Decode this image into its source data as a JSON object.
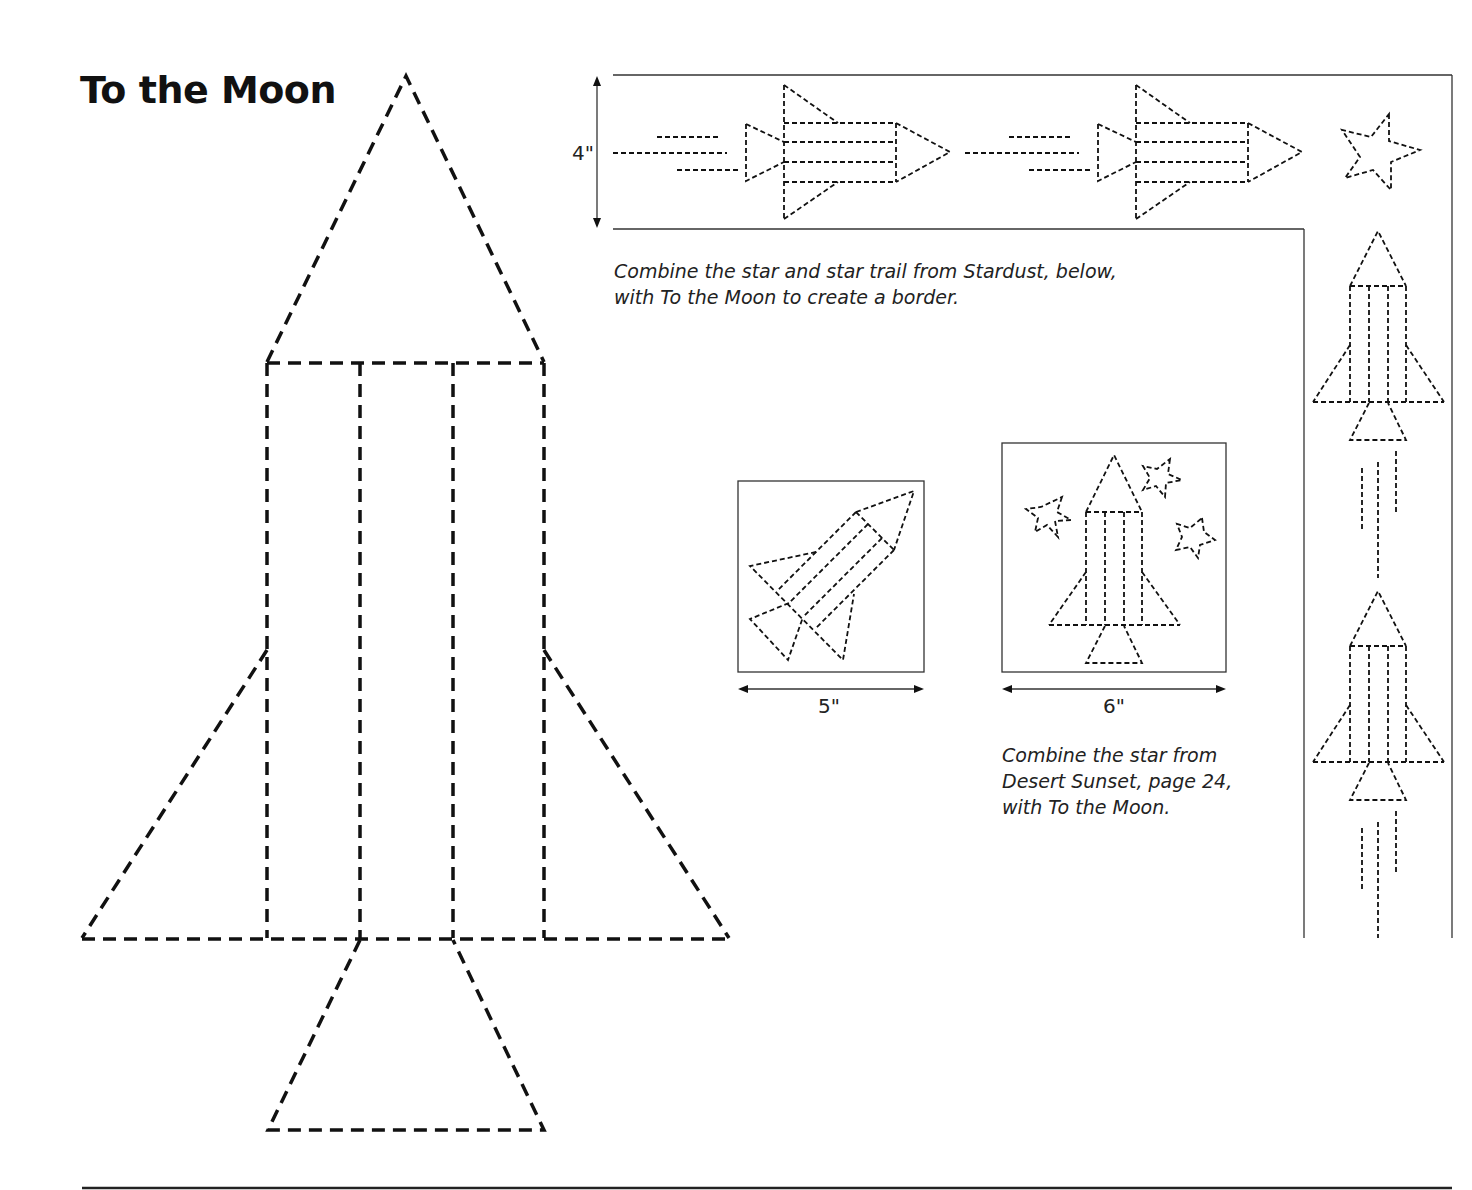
{
  "page": {
    "title": "To the Moon"
  },
  "border_block": {
    "dimension_label": "4\"",
    "caption": "Combine the star and star trail from Stardust, below, with To the Moon to create a border."
  },
  "block_5in": {
    "dimension_label": "5\""
  },
  "block_6in": {
    "dimension_label": "6\"",
    "caption": "Combine the star from Desert Sunset, page 24, with To the Moon."
  },
  "icons": {
    "main_pattern": "rocket-template",
    "border_motifs": [
      "rocket-horizontal",
      "rocket-horizontal",
      "star",
      "rocket-vertical",
      "rocket-vertical"
    ],
    "block_5_motif": "rocket-diagonal",
    "block_6_motifs": [
      "rocket-vertical",
      "star",
      "star",
      "star"
    ]
  },
  "colors": {
    "ink": "#111111",
    "background": "#ffffff"
  }
}
